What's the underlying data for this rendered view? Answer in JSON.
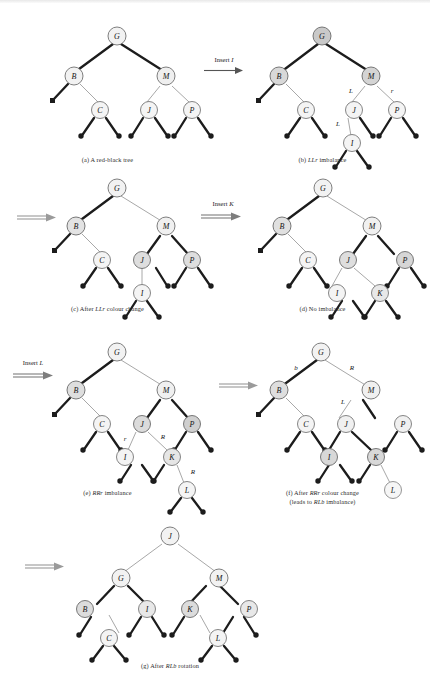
{
  "figure": {
    "colors": {
      "black_pointer": "#1c1c1c",
      "red_pointer": "#9d9d9d",
      "node_fill": "#f2f2f2",
      "node_stroke": "#6e6e6e",
      "text": "#1a1a1a"
    }
  },
  "panels": [
    {
      "id": "a",
      "caption": "(a) A red-black tree",
      "caption_italic": "",
      "nodes": [
        "G",
        "B",
        "M",
        "C",
        "J",
        "P"
      ]
    },
    {
      "id": "b",
      "caption_pre": "(b) ",
      "caption_it": "LLr",
      "caption_post": " imbalance",
      "nodes": [
        "G",
        "B",
        "M",
        "C",
        "J",
        "P",
        "I"
      ],
      "edge_labels": [
        "L",
        "r",
        "L"
      ]
    },
    {
      "id": "c",
      "caption_pre": "(c) After ",
      "caption_it": "LLr",
      "caption_post": " colour change",
      "nodes": [
        "G",
        "B",
        "M",
        "C",
        "J",
        "P",
        "I"
      ]
    },
    {
      "id": "d",
      "caption_pre": "(d) No imbalance",
      "caption_it": "",
      "caption_post": "",
      "nodes": [
        "G",
        "B",
        "M",
        "C",
        "J",
        "P",
        "I",
        "K"
      ]
    },
    {
      "id": "e",
      "caption_pre": "(e) ",
      "caption_it": "RRr",
      "caption_post": " imbalance",
      "nodes": [
        "G",
        "B",
        "M",
        "C",
        "J",
        "P",
        "I",
        "K",
        "L"
      ],
      "edge_labels": [
        "r",
        "R",
        "R"
      ]
    },
    {
      "id": "f",
      "caption_pre": "(f) After ",
      "caption_it": "RRr",
      "caption_post": " colour change",
      "caption_line2_pre": "(leads to ",
      "caption_line2_it": "RLb",
      "caption_line2_post": " imbalance)",
      "nodes": [
        "G",
        "B",
        "M",
        "C",
        "J",
        "P",
        "I",
        "K",
        "L"
      ],
      "edge_labels": [
        "b",
        "R",
        "L"
      ]
    },
    {
      "id": "g",
      "caption_pre": "(g) After ",
      "caption_it": "RLb",
      "caption_post": " rotation",
      "nodes": [
        "J",
        "G",
        "M",
        "B",
        "I",
        "K",
        "P",
        "C",
        "L"
      ]
    }
  ],
  "steps": [
    {
      "id": "insert-i",
      "label_pre": "Insert ",
      "label_it": "I"
    },
    {
      "id": "arrow-c",
      "label_pre": "",
      "label_it": ""
    },
    {
      "id": "insert-k",
      "label_pre": "Insert ",
      "label_it": "K"
    },
    {
      "id": "insert-l",
      "label_pre": "Insert ",
      "label_it": "L"
    },
    {
      "id": "arrow-f",
      "label_pre": "",
      "label_it": ""
    },
    {
      "id": "arrow-g",
      "label_pre": "",
      "label_it": ""
    }
  ],
  "node_labels": {
    "G": "G",
    "B": "B",
    "M": "M",
    "C": "C",
    "J": "J",
    "P": "P",
    "I": "I",
    "K": "K",
    "L": "L"
  },
  "edge_label_text": {
    "L": "L",
    "R": "R",
    "r": "r",
    "b": "b"
  }
}
